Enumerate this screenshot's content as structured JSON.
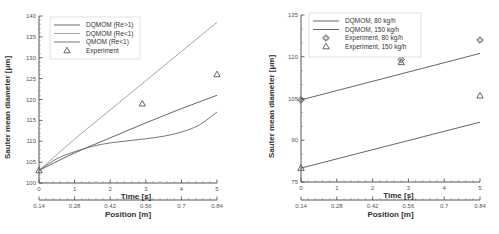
{
  "chart_data": [
    {
      "type": "line",
      "ylabel": "Sauter mean diameter [μm]",
      "xlabel": "Time [s]",
      "x2label": "Position [m]",
      "xlim": [
        0,
        5
      ],
      "ylim": [
        100,
        140
      ],
      "xticks": [
        "0",
        "1",
        "2",
        "3",
        "4",
        "5"
      ],
      "x2ticks": [
        "0.14",
        "0.28",
        "0.42",
        "0.56",
        "0.7",
        "0.84"
      ],
      "yticks": [
        "100",
        "105",
        "110",
        "115",
        "120",
        "125",
        "130",
        "135",
        "140"
      ],
      "legend_position": "upper left",
      "series": [
        {
          "name": "DQMOM (Re>1)",
          "style": "line",
          "color": "#555555",
          "x": [
            0,
            1,
            2,
            3,
            4,
            5
          ],
          "values": [
            103,
            107.2,
            110.8,
            114.4,
            117.8,
            121
          ]
        },
        {
          "name": "DQMOM (Re<1)",
          "style": "line",
          "color": "#9a9a9a",
          "x": [
            0,
            1,
            2,
            3,
            4,
            5
          ],
          "values": [
            103,
            110.5,
            117.5,
            124.5,
            131.5,
            138.5
          ]
        },
        {
          "name": "QMOM (Re<1)",
          "style": "line",
          "color": "#666666",
          "x": [
            0,
            0.5,
            1,
            1.5,
            2,
            2.5,
            3,
            3.5,
            4,
            4.5,
            5
          ],
          "values": [
            103,
            105.8,
            107.5,
            108.8,
            109.6,
            110.1,
            110.6,
            111.2,
            112.2,
            113.9,
            117
          ]
        },
        {
          "name": "Experiment",
          "style": "triangle",
          "color": "#555555",
          "x": [
            0,
            2.9,
            5
          ],
          "values": [
            103,
            119,
            126
          ]
        }
      ]
    },
    {
      "type": "line",
      "ylabel": "Sauter mean diameter [μm]",
      "xlabel": "Time [s]",
      "x2label": "Position [m]",
      "xlim": [
        0,
        5
      ],
      "ylim": [
        75,
        135
      ],
      "xticks": [
        "0",
        "1",
        "2",
        "3",
        "4",
        "5"
      ],
      "x2ticks": [
        "0.14",
        "0.28",
        "0.42",
        "0.56",
        "0.7",
        "0.84"
      ],
      "yticks": [
        "75",
        "90",
        "105",
        "120",
        "135"
      ],
      "legend_position": "upper left",
      "series": [
        {
          "name": "DQMOM, 80 kg/h",
          "style": "line",
          "color": "#555555",
          "x": [
            0,
            5
          ],
          "values": [
            104.5,
            121.2
          ]
        },
        {
          "name": "DQMOM, 150 kg/h",
          "style": "line",
          "color": "#555555",
          "x": [
            0,
            5
          ],
          "values": [
            80,
            96.5
          ]
        },
        {
          "name": "Experiment, 80 kg/h",
          "style": "diamond",
          "color": "#555555",
          "x": [
            0,
            2.8,
            5
          ],
          "values": [
            104.5,
            119,
            126
          ]
        },
        {
          "name": "Experiment, 150 kg/h",
          "style": "triangle",
          "color": "#555555",
          "x": [
            0,
            2.8,
            5
          ],
          "values": [
            80,
            118,
            106
          ]
        }
      ]
    }
  ],
  "left": {
    "ylabel": "Sauter mean diameter [μm]",
    "xlabel": "Time [s]",
    "x2label": "Position [m]",
    "legend": [
      "DQMOM (Re>1)",
      "DQMOM (Re<1)",
      "QMOM (Ro<1)",
      "Experiment"
    ]
  },
  "right": {
    "ylabel": "Sauter mean diameter [μm]",
    "xlabel": "Time [s]",
    "x2label": "Position [m]",
    "legend": [
      "DQMOM, 80 kg/h",
      "DQMOM, 150 kg/h",
      "Experiment, 80 kg/h",
      "Experiment, 150 kg/h"
    ]
  }
}
